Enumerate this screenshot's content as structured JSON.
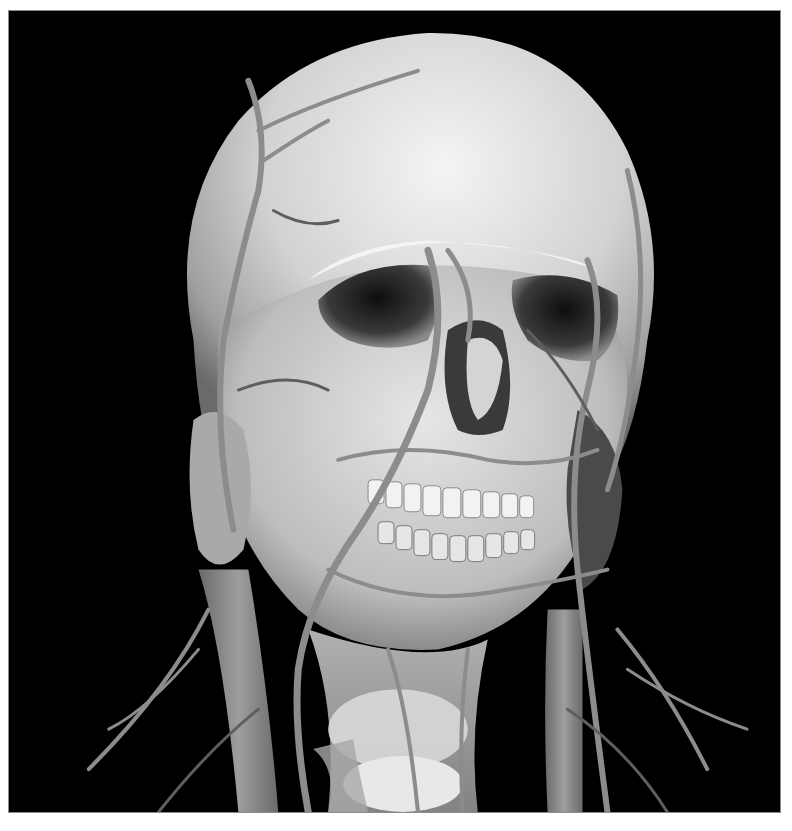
{
  "image": {
    "subject": "3D volume rendering of human skull with superficial head and neck vasculature",
    "style": "grayscale",
    "background_color": "#000000",
    "page_background_color": "#ffffff",
    "border_color": "#8a8a8a",
    "colors": {
      "bone_highlight": "#f2f2f2",
      "bone_mid": "#c8c8c8",
      "bone_shadow": "#6e6e6e",
      "vessel": "#8c8c8c",
      "vessel_dark": "#5e5e5e",
      "cavity": "#1a1a1a"
    },
    "elements": [
      "cranium",
      "orbits",
      "nasal-cavity",
      "maxilla",
      "mandible",
      "teeth",
      "arteries-and-veins",
      "parotid-gland",
      "larynx",
      "thyroid-cartilage",
      "internal-jugular-vein"
    ]
  }
}
